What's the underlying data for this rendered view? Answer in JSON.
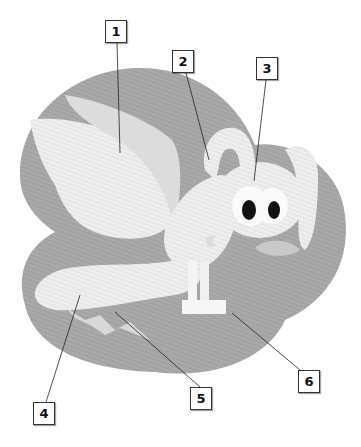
{
  "diagram": {
    "colors": {
      "background_blob": "#a9a9a9",
      "body": "#ececec",
      "eye": "#111111",
      "leader_line": "#222222",
      "label_border": "#333333"
    },
    "labels": [
      {
        "id": "1",
        "text": "1",
        "target": "wing"
      },
      {
        "id": "2",
        "text": "2",
        "target": "ear"
      },
      {
        "id": "3",
        "text": "3",
        "target": "head"
      },
      {
        "id": "4",
        "text": "4",
        "target": "tail"
      },
      {
        "id": "5",
        "text": "5",
        "target": "tail stripes"
      },
      {
        "id": "6",
        "text": "6",
        "target": "front feet"
      }
    ]
  }
}
